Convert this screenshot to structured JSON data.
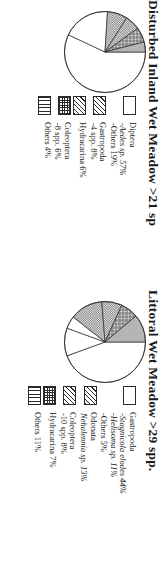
{
  "charts": [
    {
      "id": "disturbed-inland-wet-meadow",
      "title": "Disturbed Inland Wet Meadow >21 sp",
      "legend": [
        {
          "pattern": "blank",
          "main": "Diptera",
          "main_italic": false,
          "subs": [
            {
              "text": "-Aedes sp.  57%",
              "italic": true
            },
            {
              "text": "-Others  19%",
              "italic": false
            }
          ]
        },
        {
          "pattern": "diag",
          "main": "Gastropoda",
          "main_italic": false,
          "subs": [
            {
              "text": "-4 spp.  8%",
              "italic": false
            }
          ]
        },
        {
          "pattern": "diag",
          "main": "Hydracarina  6%",
          "main_italic": false,
          "subs": []
        },
        {
          "pattern": "check",
          "main": "Coleoptera",
          "main_italic": false,
          "subs": [
            {
              "text": "-8 spp.  6%",
              "italic": false
            }
          ]
        },
        {
          "pattern": "vert",
          "main": "Others  4%",
          "main_italic": false,
          "subs": []
        }
      ]
    },
    {
      "id": "littoral-wet-meadow",
      "title": "Littoral Wet Meadow >29 spp.",
      "legend": [
        {
          "pattern": "blank",
          "main": "Gastropoda",
          "main_italic": false,
          "subs": [
            {
              "text": "-Stagnicola elodes  44%",
              "italic": true
            },
            {
              "text": "-Helisoma sp.  11%",
              "italic": true
            },
            {
              "text": "-Others  5%",
              "italic": false
            }
          ]
        },
        {
          "pattern": "diag",
          "main": "Odonata",
          "main_italic": false,
          "subs": [
            {
              "text": "Nehalennia sp.  13%",
              "italic": true
            }
          ]
        },
        {
          "pattern": "diag",
          "main": "Coleoptera",
          "main_italic": false,
          "subs": [
            {
              "text": "-10 spp.  8%",
              "italic": false
            }
          ]
        },
        {
          "pattern": "check",
          "main": "Hydracarina  7%",
          "main_italic": false,
          "subs": []
        },
        {
          "pattern": "vert",
          "main": "Others  11%",
          "main_italic": false,
          "subs": []
        }
      ]
    }
  ],
  "chart_data": [
    {
      "type": "pie",
      "title": "Disturbed Inland Wet Meadow >21 sp",
      "labels": [
        "Diptera - Aedes sp.",
        "Diptera - Others",
        "Gastropoda - 4 spp.",
        "Hydracarina",
        "Coleoptera - 8 spp.",
        "Others"
      ],
      "values": [
        57,
        19,
        8,
        6,
        6,
        4
      ],
      "units": "%",
      "patterns": [
        "blank",
        "blank",
        "diagonal-hatch",
        "diagonal-hatch",
        "checker",
        "vertical-lines"
      ],
      "legend_position": "above-chart",
      "grid": false
    },
    {
      "type": "pie",
      "title": "Littoral Wet Meadow >29 spp.",
      "labels": [
        "Gastropoda - Stagnicola elodes",
        "Gastropoda - Helisoma sp.",
        "Gastropoda - Others",
        "Odonata - Nehalennia sp.",
        "Coleoptera - 10 spp.",
        "Hydracarina",
        "Others"
      ],
      "values": [
        44,
        11,
        5,
        13,
        8,
        7,
        11
      ],
      "units": "%",
      "patterns": [
        "blank",
        "blank",
        "blank",
        "diagonal-hatch",
        "diagonal-hatch",
        "checker",
        "vertical-lines"
      ],
      "legend_position": "above-chart",
      "grid": false
    }
  ]
}
